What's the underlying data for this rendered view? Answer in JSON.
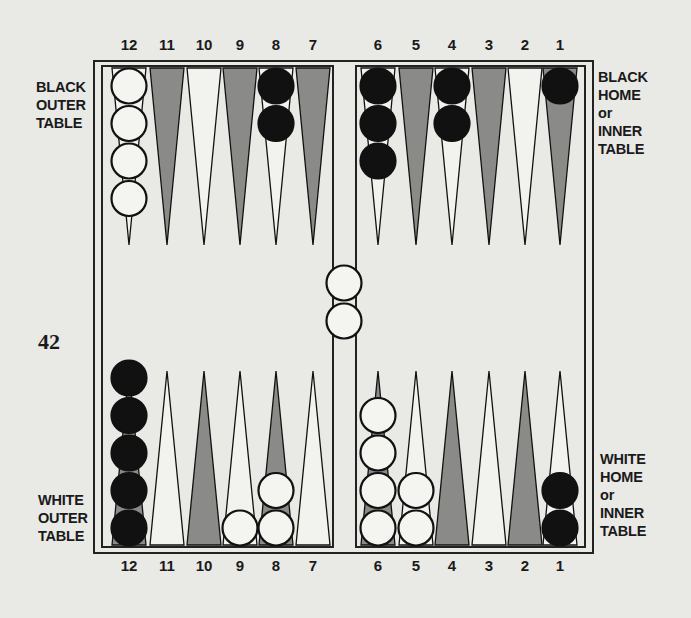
{
  "page_number": "42",
  "labels": {
    "black_outer": [
      "BLACK",
      "OUTER",
      "TABLE"
    ],
    "black_home": [
      "BLACK",
      "HOME",
      "or",
      "INNER",
      "TABLE"
    ],
    "white_outer": [
      "WHITE",
      "OUTER",
      "TABLE"
    ],
    "white_home": [
      "WHITE",
      "HOME",
      "or",
      "INNER",
      "TABLE"
    ]
  },
  "top_numbers": [
    "12",
    "11",
    "10",
    "9",
    "8",
    "7",
    "6",
    "5",
    "4",
    "3",
    "2",
    "1"
  ],
  "bottom_numbers": [
    "12",
    "11",
    "10",
    "9",
    "8",
    "7",
    "6",
    "5",
    "4",
    "3",
    "2",
    "1"
  ],
  "colors": {
    "paper": "#e9e9e6",
    "dark_point": "#8a8a88",
    "light_point": "#f2f2ef",
    "ink": "#111111",
    "checker_white": "#f4f4f1"
  },
  "board": {
    "top_points": [
      {
        "label": "12",
        "shade": "light",
        "checkers": {
          "color": "white",
          "count": 4
        }
      },
      {
        "label": "11",
        "shade": "dark",
        "checkers": null
      },
      {
        "label": "10",
        "shade": "light",
        "checkers": null
      },
      {
        "label": "9",
        "shade": "dark",
        "checkers": null
      },
      {
        "label": "8",
        "shade": "light",
        "checkers": {
          "color": "black",
          "count": 2
        }
      },
      {
        "label": "7",
        "shade": "dark",
        "checkers": null
      },
      {
        "label": "6",
        "shade": "light",
        "checkers": {
          "color": "black",
          "count": 3
        }
      },
      {
        "label": "5",
        "shade": "dark",
        "checkers": null
      },
      {
        "label": "4",
        "shade": "light",
        "checkers": {
          "color": "black",
          "count": 2
        }
      },
      {
        "label": "3",
        "shade": "dark",
        "checkers": null
      },
      {
        "label": "2",
        "shade": "light",
        "checkers": null
      },
      {
        "label": "1",
        "shade": "dark",
        "checkers": {
          "color": "black",
          "count": 1
        }
      }
    ],
    "bottom_points": [
      {
        "label": "12",
        "shade": "dark",
        "checkers": {
          "color": "black",
          "count": 5
        }
      },
      {
        "label": "11",
        "shade": "light",
        "checkers": null
      },
      {
        "label": "10",
        "shade": "dark",
        "checkers": null
      },
      {
        "label": "9",
        "shade": "light",
        "checkers": {
          "color": "white",
          "count": 1
        }
      },
      {
        "label": "8",
        "shade": "dark",
        "checkers": {
          "color": "white",
          "count": 2
        }
      },
      {
        "label": "7",
        "shade": "light",
        "checkers": null
      },
      {
        "label": "6",
        "shade": "dark",
        "checkers": {
          "color": "white",
          "count": 4
        }
      },
      {
        "label": "5",
        "shade": "light",
        "checkers": {
          "color": "white",
          "count": 2
        }
      },
      {
        "label": "4",
        "shade": "dark",
        "checkers": null
      },
      {
        "label": "3",
        "shade": "light",
        "checkers": null
      },
      {
        "label": "2",
        "shade": "dark",
        "checkers": null
      },
      {
        "label": "1",
        "shade": "light",
        "checkers": {
          "color": "black",
          "count": 2
        }
      }
    ],
    "bar": {
      "color": "white",
      "count": 2
    }
  }
}
